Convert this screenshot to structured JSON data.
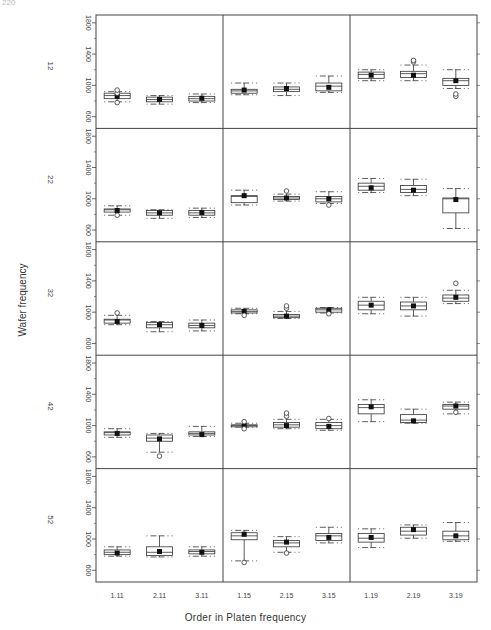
{
  "page_number": "220",
  "chart_data": {
    "type": "boxplot-trellis",
    "title": "",
    "xlabel": "Order in Platen frequency",
    "ylabel": "Wafer frequency",
    "ylim": [
      450,
      1900
    ],
    "yticks": [
      600,
      1000,
      1400,
      1800
    ],
    "row_labels": [
      "12",
      "22",
      "32",
      "42",
      "52"
    ],
    "column_groups": [
      "11",
      "15",
      "19"
    ],
    "categories": [
      "1.11",
      "2.11",
      "3.11",
      "1.15",
      "2.15",
      "3.15",
      "1.19",
      "2.19",
      "3.19"
    ],
    "grid": false,
    "rows": [
      {
        "label": "12",
        "boxes": [
          {
            "cat": "1.11",
            "lo": 790,
            "q1": 830,
            "med": 870,
            "q3": 900,
            "hi": 920,
            "mean": 860,
            "outliers": [
              780,
              900,
              940
            ]
          },
          {
            "cat": "2.11",
            "lo": 760,
            "q1": 790,
            "med": 820,
            "q3": 850,
            "hi": 870,
            "mean": 820,
            "outliers": []
          },
          {
            "cat": "3.11",
            "lo": 780,
            "q1": 800,
            "med": 830,
            "q3": 860,
            "hi": 890,
            "mean": 835,
            "outliers": []
          },
          {
            "cat": "1.15",
            "lo": 880,
            "q1": 900,
            "med": 930,
            "q3": 950,
            "hi": 1030,
            "mean": 940,
            "outliers": []
          },
          {
            "cat": "2.15",
            "lo": 870,
            "q1": 920,
            "med": 950,
            "q3": 980,
            "hi": 1030,
            "mean": 960,
            "outliers": []
          },
          {
            "cat": "3.15",
            "lo": 910,
            "q1": 930,
            "med": 990,
            "q3": 1030,
            "hi": 1120,
            "mean": 975,
            "outliers": []
          },
          {
            "cat": "1.19",
            "lo": 1060,
            "q1": 1090,
            "med": 1140,
            "q3": 1170,
            "hi": 1200,
            "mean": 1130,
            "outliers": []
          },
          {
            "cat": "2.19",
            "lo": 1060,
            "q1": 1100,
            "med": 1150,
            "q3": 1180,
            "hi": 1260,
            "mean": 1130,
            "outliers": [
              1300,
              1320
            ]
          },
          {
            "cat": "3.19",
            "lo": 960,
            "q1": 1000,
            "med": 1060,
            "q3": 1090,
            "hi": 1200,
            "mean": 1060,
            "outliers": [
              860,
              890
            ]
          }
        ]
      },
      {
        "label": "22",
        "boxes": [
          {
            "cat": "1.11",
            "lo": 790,
            "q1": 830,
            "med": 860,
            "q3": 870,
            "hi": 910,
            "mean": 850,
            "outliers": [
              790
            ]
          },
          {
            "cat": "2.11",
            "lo": 750,
            "q1": 790,
            "med": 820,
            "q3": 850,
            "hi": 860,
            "mean": 820,
            "outliers": []
          },
          {
            "cat": "3.11",
            "lo": 760,
            "q1": 790,
            "med": 820,
            "q3": 850,
            "hi": 880,
            "mean": 825,
            "outliers": []
          },
          {
            "cat": "1.15",
            "lo": 920,
            "q1": 950,
            "med": 1030,
            "q3": 1040,
            "hi": 1110,
            "mean": 1040,
            "outliers": []
          },
          {
            "cat": "2.15",
            "lo": 970,
            "q1": 990,
            "med": 1010,
            "q3": 1030,
            "hi": 1060,
            "mean": 1010,
            "outliers": [
              1100
            ]
          },
          {
            "cat": "3.15",
            "lo": 940,
            "q1": 960,
            "med": 1000,
            "q3": 1030,
            "hi": 1090,
            "mean": 1000,
            "outliers": [
              920
            ]
          },
          {
            "cat": "1.19",
            "lo": 1080,
            "q1": 1110,
            "med": 1160,
            "q3": 1200,
            "hi": 1260,
            "mean": 1140,
            "outliers": []
          },
          {
            "cat": "2.19",
            "lo": 1040,
            "q1": 1080,
            "med": 1120,
            "q3": 1170,
            "hi": 1250,
            "mean": 1110,
            "outliers": []
          },
          {
            "cat": "3.19",
            "lo": 620,
            "q1": 820,
            "med": 1000,
            "q3": 1010,
            "hi": 1130,
            "mean": 990,
            "outliers": []
          }
        ]
      },
      {
        "label": "32",
        "boxes": [
          {
            "cat": "1.11",
            "lo": 840,
            "q1": 860,
            "med": 900,
            "q3": 910,
            "hi": 960,
            "mean": 880,
            "outliers": [
              990
            ]
          },
          {
            "cat": "2.11",
            "lo": 750,
            "q1": 800,
            "med": 840,
            "q3": 870,
            "hi": 880,
            "mean": 840,
            "outliers": []
          },
          {
            "cat": "3.11",
            "lo": 760,
            "q1": 800,
            "med": 830,
            "q3": 860,
            "hi": 900,
            "mean": 830,
            "outliers": []
          },
          {
            "cat": "1.15",
            "lo": 980,
            "q1": 990,
            "med": 1010,
            "q3": 1030,
            "hi": 1050,
            "mean": 1010,
            "outliers": [
              960
            ]
          },
          {
            "cat": "2.15",
            "lo": 920,
            "q1": 930,
            "med": 950,
            "q3": 970,
            "hi": 1010,
            "mean": 950,
            "outliers": [
              1050,
              1080
            ]
          },
          {
            "cat": "3.15",
            "lo": 990,
            "q1": 1000,
            "med": 1030,
            "q3": 1050,
            "hi": 1060,
            "mean": 1030,
            "outliers": [
              980
            ]
          },
          {
            "cat": "1.19",
            "lo": 980,
            "q1": 1030,
            "med": 1090,
            "q3": 1140,
            "hi": 1190,
            "mean": 1090,
            "outliers": []
          },
          {
            "cat": "2.19",
            "lo": 950,
            "q1": 1030,
            "med": 1080,
            "q3": 1130,
            "hi": 1190,
            "mean": 1080,
            "outliers": []
          },
          {
            "cat": "3.19",
            "lo": 1110,
            "q1": 1140,
            "med": 1180,
            "q3": 1220,
            "hi": 1280,
            "mean": 1190,
            "outliers": [
              1370
            ]
          }
        ]
      },
      {
        "label": "42",
        "boxes": [
          {
            "cat": "1.11",
            "lo": 850,
            "q1": 880,
            "med": 910,
            "q3": 920,
            "hi": 960,
            "mean": 900,
            "outliers": []
          },
          {
            "cat": "2.11",
            "lo": 660,
            "q1": 800,
            "med": 840,
            "q3": 880,
            "hi": 900,
            "mean": 830,
            "outliers": [
              610
            ]
          },
          {
            "cat": "3.11",
            "lo": 860,
            "q1": 880,
            "med": 900,
            "q3": 920,
            "hi": 990,
            "mean": 885,
            "outliers": []
          },
          {
            "cat": "1.15",
            "lo": 980,
            "q1": 990,
            "med": 1000,
            "q3": 1010,
            "hi": 1030,
            "mean": 1000,
            "outliers": [
              960,
              1050
            ]
          },
          {
            "cat": "2.15",
            "lo": 960,
            "q1": 980,
            "med": 1010,
            "q3": 1040,
            "hi": 1080,
            "mean": 1000,
            "outliers": [
              1120,
              1160
            ]
          },
          {
            "cat": "3.15",
            "lo": 940,
            "q1": 960,
            "med": 1000,
            "q3": 1040,
            "hi": 1080,
            "mean": 990,
            "outliers": [
              1090
            ]
          },
          {
            "cat": "1.19",
            "lo": 1050,
            "q1": 1150,
            "med": 1230,
            "q3": 1270,
            "hi": 1330,
            "mean": 1240,
            "outliers": []
          },
          {
            "cat": "2.19",
            "lo": 1030,
            "q1": 1040,
            "med": 1070,
            "q3": 1140,
            "hi": 1210,
            "mean": 1060,
            "outliers": []
          },
          {
            "cat": "3.19",
            "lo": 1150,
            "q1": 1210,
            "med": 1250,
            "q3": 1270,
            "hi": 1300,
            "mean": 1250,
            "outliers": [
              1170
            ]
          }
        ]
      },
      {
        "label": "52",
        "boxes": [
          {
            "cat": "1.11",
            "lo": 780,
            "q1": 800,
            "med": 830,
            "q3": 860,
            "hi": 900,
            "mean": 820,
            "outliers": []
          },
          {
            "cat": "2.11",
            "lo": 770,
            "q1": 790,
            "med": 830,
            "q3": 900,
            "hi": 1040,
            "mean": 840,
            "outliers": []
          },
          {
            "cat": "3.11",
            "lo": 780,
            "q1": 810,
            "med": 840,
            "q3": 860,
            "hi": 900,
            "mean": 830,
            "outliers": []
          },
          {
            "cat": "1.15",
            "lo": 720,
            "q1": 990,
            "med": 1040,
            "q3": 1080,
            "hi": 1110,
            "mean": 1060,
            "outliers": [
              700
            ]
          },
          {
            "cat": "2.15",
            "lo": 830,
            "q1": 900,
            "med": 950,
            "q3": 980,
            "hi": 1030,
            "mean": 960,
            "outliers": [
              820
            ]
          },
          {
            "cat": "3.15",
            "lo": 950,
            "q1": 980,
            "med": 1040,
            "q3": 1070,
            "hi": 1150,
            "mean": 1020,
            "outliers": []
          },
          {
            "cat": "1.19",
            "lo": 890,
            "q1": 960,
            "med": 1010,
            "q3": 1070,
            "hi": 1130,
            "mean": 1020,
            "outliers": []
          },
          {
            "cat": "2.19",
            "lo": 1010,
            "q1": 1050,
            "med": 1100,
            "q3": 1150,
            "hi": 1180,
            "mean": 1120,
            "outliers": []
          },
          {
            "cat": "3.19",
            "lo": 970,
            "q1": 990,
            "med": 1040,
            "q3": 1100,
            "hi": 1210,
            "mean": 1040,
            "outliers": []
          }
        ]
      }
    ]
  },
  "colors": {
    "frame": "#444444",
    "box": "#333333",
    "mean_dot": "#111111",
    "tick_text": "#444444"
  }
}
